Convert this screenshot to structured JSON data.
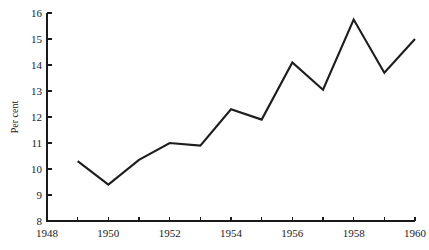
{
  "chart_data": {
    "type": "line",
    "title": "",
    "subtitle": "",
    "xlabel": "",
    "ylabel": "Per cent",
    "xlim": [
      1948,
      1960
    ],
    "ylim": [
      8,
      16
    ],
    "grid": false,
    "legend": null,
    "x": [
      1949,
      1950,
      1951,
      1952,
      1953,
      1954,
      1955,
      1956,
      1957,
      1958,
      1959,
      1960
    ],
    "values": [
      10.3,
      9.4,
      10.35,
      11.0,
      10.9,
      12.3,
      11.9,
      14.1,
      13.05,
      15.75,
      13.7,
      15.0
    ],
    "series": [
      {
        "name": "Per cent",
        "color": "#1d1d1d",
        "values": [
          10.3,
          9.4,
          10.35,
          11.0,
          10.9,
          12.3,
          11.9,
          14.1,
          13.05,
          15.75,
          13.7,
          15.0
        ]
      }
    ],
    "x_tick_values": [
      1948,
      1949,
      1950,
      1951,
      1952,
      1953,
      1954,
      1955,
      1956,
      1957,
      1958,
      1959,
      1960
    ],
    "x_tick_labels": [
      "1948",
      "",
      "1950",
      "",
      "1952",
      "",
      "1954",
      "",
      "1956",
      "",
      "1958",
      "",
      "1960"
    ],
    "y_tick_values": [
      8,
      9,
      10,
      11,
      12,
      13,
      14,
      15,
      16
    ],
    "y_tick_labels": [
      "8",
      "9",
      "10",
      "11",
      "12",
      "13",
      "14",
      "15",
      "16"
    ]
  },
  "axes": {
    "y_axis_title": "Per cent",
    "x_labels": [
      "1948",
      "1950",
      "1952",
      "1954",
      "1956",
      "1958",
      "1960"
    ],
    "y_labels": [
      "16",
      "15",
      "14",
      "13",
      "12",
      "11",
      "10",
      "9",
      "8"
    ]
  },
  "colors": {
    "line": "#1d1d1d",
    "axis": "#1a1a1a",
    "background": "#ffffff"
  }
}
